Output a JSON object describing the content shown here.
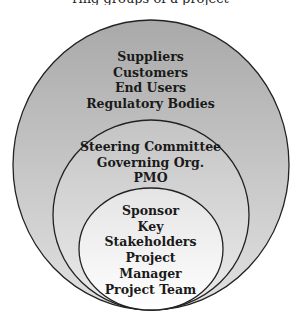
{
  "clipped_caption": "ring groups of a project",
  "diagram": {
    "type": "nested-circles",
    "rings": [
      {
        "level": "outer",
        "labels": [
          "Suppliers",
          "Customers",
          "End Users",
          "Regulatory Bodies"
        ],
        "fill_top": "#a9a9a9",
        "fill_bottom": "#e2e2e2"
      },
      {
        "level": "middle",
        "labels": [
          "Steering Committee",
          "Governing Org.",
          "PMO"
        ],
        "fill_top": "#c4c4c4",
        "fill_bottom": "#ececec"
      },
      {
        "level": "inner",
        "labels": [
          "Sponsor",
          "Key",
          "Stakeholders",
          "Project",
          "Manager",
          "Project Team"
        ],
        "fill_top": "#e4e4e4",
        "fill_bottom": "#ffffff"
      }
    ],
    "stroke_color": "#222222"
  }
}
